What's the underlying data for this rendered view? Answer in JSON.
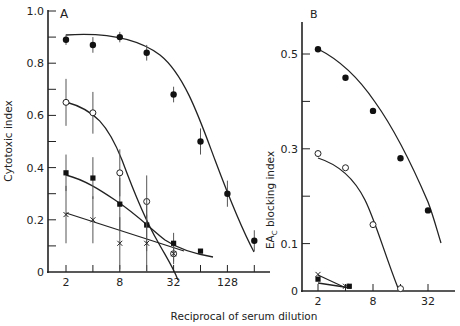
{
  "chart_data": [
    {
      "panel": "A",
      "type": "line",
      "title": "A",
      "xlabel": "Reciprocal of serum dilution",
      "ylabel": "Cytotoxic index",
      "xscale": "log2",
      "xticks": [
        2,
        4,
        8,
        16,
        32,
        64,
        128,
        256
      ],
      "xtick_labels": [
        "2",
        "",
        "8",
        "",
        "32",
        "",
        "128",
        ""
      ],
      "yticks": [
        0,
        0.1,
        0.2,
        0.3,
        0.4,
        0.5,
        0.6,
        0.7,
        0.8,
        0.9,
        1.0
      ],
      "ytick_labels": [
        "0",
        "",
        "0.2",
        "",
        "0.4",
        "",
        "0.6",
        "",
        "0.8",
        "",
        "1.0"
      ],
      "ylim": [
        0,
        1.0
      ],
      "grid": false,
      "series": [
        {
          "name": "filled circles",
          "marker": "filled-circle",
          "x": [
            2,
            4,
            8,
            16,
            32,
            64,
            128,
            256
          ],
          "y": [
            0.89,
            0.87,
            0.9,
            0.84,
            0.68,
            0.5,
            0.3,
            0.12
          ],
          "err": [
            0.02,
            0.03,
            0.02,
            0.03,
            0.03,
            0.05,
            0.05,
            0.04
          ]
        },
        {
          "name": "open circles",
          "marker": "open-circle",
          "x": [
            2,
            4,
            8,
            16,
            32
          ],
          "y": [
            0.65,
            0.61,
            0.38,
            0.27,
            0.07
          ],
          "err": [
            0.09,
            0.08,
            0.09,
            0.1,
            0.04
          ]
        },
        {
          "name": "filled squares",
          "marker": "filled-square",
          "x": [
            2,
            4,
            8,
            16,
            32,
            64
          ],
          "y": [
            0.38,
            0.36,
            0.26,
            0.18,
            0.11,
            0.08
          ],
          "err": [
            0.07,
            0.08,
            0.1,
            0.1,
            0.04,
            0.0
          ]
        },
        {
          "name": "crosses",
          "marker": "cross",
          "x": [
            2,
            4,
            8,
            16,
            32
          ],
          "y": [
            0.22,
            0.2,
            0.11,
            0.11,
            0.07
          ],
          "err": [
            0.11,
            0.09,
            0.1,
            0.11,
            0.03
          ]
        }
      ]
    },
    {
      "panel": "B",
      "type": "line",
      "title": "B",
      "xlabel": "Reciprocal of serum dilution",
      "ylabel": "EA₁ blocking index",
      "ylabel_main": "EA",
      "ylabel_sub": "C",
      "ylabel_rest": " blocking index",
      "xscale": "log2",
      "xticks": [
        2,
        4,
        8,
        16,
        32
      ],
      "xtick_labels": [
        "2",
        "",
        "8",
        "",
        "32"
      ],
      "yticks": [
        0,
        0.1,
        0.2,
        0.3,
        0.4,
        0.5
      ],
      "ytick_labels": [
        "0",
        "0.1",
        "",
        "0.3",
        "",
        "0.5"
      ],
      "ylim": [
        0,
        0.58
      ],
      "grid": false,
      "series": [
        {
          "name": "filled circles",
          "marker": "filled-circle",
          "x": [
            2,
            4,
            8,
            16,
            32
          ],
          "y": [
            0.51,
            0.45,
            0.38,
            0.28,
            0.17
          ]
        },
        {
          "name": "open circles",
          "marker": "open-circle",
          "x": [
            2,
            4,
            8,
            16
          ],
          "y": [
            0.29,
            0.26,
            0.14,
            0.005
          ]
        },
        {
          "name": "filled squares",
          "marker": "filled-square",
          "x": [
            2,
            4.4
          ],
          "y": [
            0.025,
            0.01
          ]
        },
        {
          "name": "crosses",
          "marker": "cross",
          "x": [
            2,
            4
          ],
          "y": [
            0.035,
            0.01
          ]
        }
      ]
    }
  ],
  "labels": {
    "panel_a": "A",
    "panel_b": "B",
    "xlabel": "Reciprocal of serum dilution",
    "ylabel_a": "Cytotoxic index",
    "ylabel_b_main": "EA",
    "ylabel_b_sub": "C",
    "ylabel_b_rest": " blocking index"
  }
}
